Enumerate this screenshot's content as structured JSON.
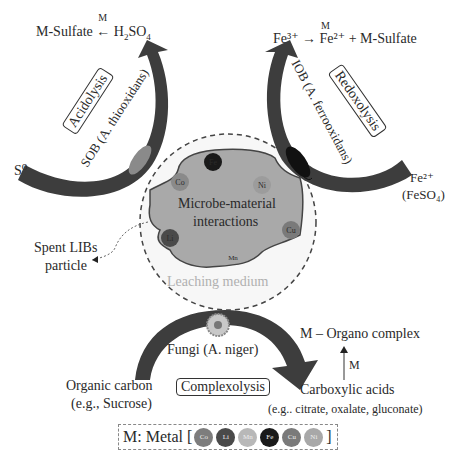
{
  "acidolysis": {
    "title": "Acidolysis",
    "organism": "SOB (A. thiooxidans)",
    "substrate": "S⁰",
    "product_left": "M-Sulfate",
    "product_arrow_label": "M",
    "product_right_main": "H",
    "product_right_sub1": "2",
    "product_right_mid": "SO",
    "product_right_sub2": "4"
  },
  "redoxolysis": {
    "title": "Redoxolysis",
    "organism": "IOB (A. ferrooxidans)",
    "substrate": "Fe²⁺",
    "substrate_note": "(FeSO₄)",
    "reaction": "Fe³⁺ → Fe²⁺ + M-Sulfate",
    "reaction_arrow_label": "M"
  },
  "center": {
    "title_line1": "Microbe-material",
    "title_line2": "interactions",
    "medium_label": "Leaching medium",
    "particle_label_line1": "Spent LIBs",
    "particle_label_line2": "particle",
    "metals_on_particle": [
      {
        "symbol": "Fe",
        "color": "#1a1a1a"
      },
      {
        "symbol": "Co",
        "color": "#8a8a8a"
      },
      {
        "symbol": "Ni",
        "color": "#a8a8a8"
      },
      {
        "symbol": "Li",
        "color": "#4a4a4a"
      },
      {
        "symbol": "Cu",
        "color": "#7a7a7a"
      },
      {
        "symbol": "Mn",
        "color": "#b5b5b5"
      }
    ]
  },
  "complexolysis": {
    "title": "Complexolysis",
    "organism": "Fungi (A. niger)",
    "substrate_line1": "Organic carbon",
    "substrate_line2": "(e.g., Sucrose)",
    "product": "Carboxylic acids",
    "product_examples": "(e.g.. citrate, oxalate, gluconate)",
    "complex": "M – Organo complex",
    "complex_arrow_label": "M"
  },
  "legend": {
    "label": "M: Metal [",
    "close": "]",
    "metals": [
      {
        "symbol": "Co",
        "color": "#7d7d7d"
      },
      {
        "symbol": "Li",
        "color": "#4a4a4a"
      },
      {
        "symbol": "Mn",
        "color": "#b8b8b8"
      },
      {
        "symbol": "Fe",
        "color": "#1a1a1a"
      },
      {
        "symbol": "Cu",
        "color": "#7a7a7a"
      },
      {
        "symbol": "Ni",
        "color": "#a8a8a8"
      }
    ]
  },
  "colors": {
    "arrow": "#3d3d3d",
    "particle": "#a9a9a9",
    "medium_dash": "#444444",
    "sob_cell": "#8a8a8a",
    "iob_cell": "#111111"
  }
}
